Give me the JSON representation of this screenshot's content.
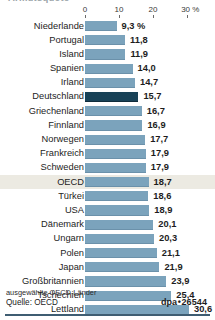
{
  "header": {
    "cut_title": "Armutsquote"
  },
  "axis": {
    "ticks": [
      "0",
      "10",
      "20",
      "30 %"
    ],
    "tick_values": [
      0,
      10,
      20,
      30
    ],
    "unit": "%"
  },
  "footer": {
    "footnote": "ausgewählte OECD-Länder",
    "source": "Quelle: OECD",
    "credit_prefix": "dpa",
    "credit_separator": "•",
    "credit_number": "26544"
  },
  "colors": {
    "bar": "#7ba3bc",
    "bar_highlight_country": "#184257",
    "row_highlight_band": "#eceae2",
    "rule": "#3f5d72",
    "text": "#1d1d1d"
  },
  "chart_data": {
    "type": "bar",
    "orientation": "horizontal",
    "title": "",
    "xlabel": "30 %",
    "ylabel": "",
    "xlim": [
      0,
      33
    ],
    "grid": false,
    "legend": "none",
    "value_decimal_separator": ",",
    "categories": [
      "Niederlande",
      "Portugal",
      "Island",
      "Spanien",
      "Irland",
      "Deutschland",
      "Griechenland",
      "Finnland",
      "Norwegen",
      "Frankreich",
      "Schweden",
      "OECD",
      "Türkei",
      "USA",
      "Dänemark",
      "Ungarn",
      "Polen",
      "Japan",
      "Großbritannien",
      "Tschechien",
      "Lettland"
    ],
    "values": [
      9.3,
      11.8,
      11.9,
      14.0,
      14.7,
      15.7,
      16.7,
      16.9,
      17.7,
      17.9,
      17.9,
      18.7,
      18.6,
      18.9,
      20.1,
      20.3,
      21.1,
      21.9,
      23.9,
      25.4,
      30.6
    ],
    "value_labels": [
      "9,3 %",
      "11,8",
      "11,9",
      "14,0",
      "14,7",
      "15,7",
      "16,7",
      "16,9",
      "17,7",
      "17,9",
      "17,9",
      "18,7",
      "18,6",
      "18,9",
      "20,1",
      "20,3",
      "21,1",
      "21,9",
      "23,9",
      "25,4",
      "30,6"
    ],
    "emphasized_category": "Deutschland",
    "highlighted_row": "OECD"
  }
}
